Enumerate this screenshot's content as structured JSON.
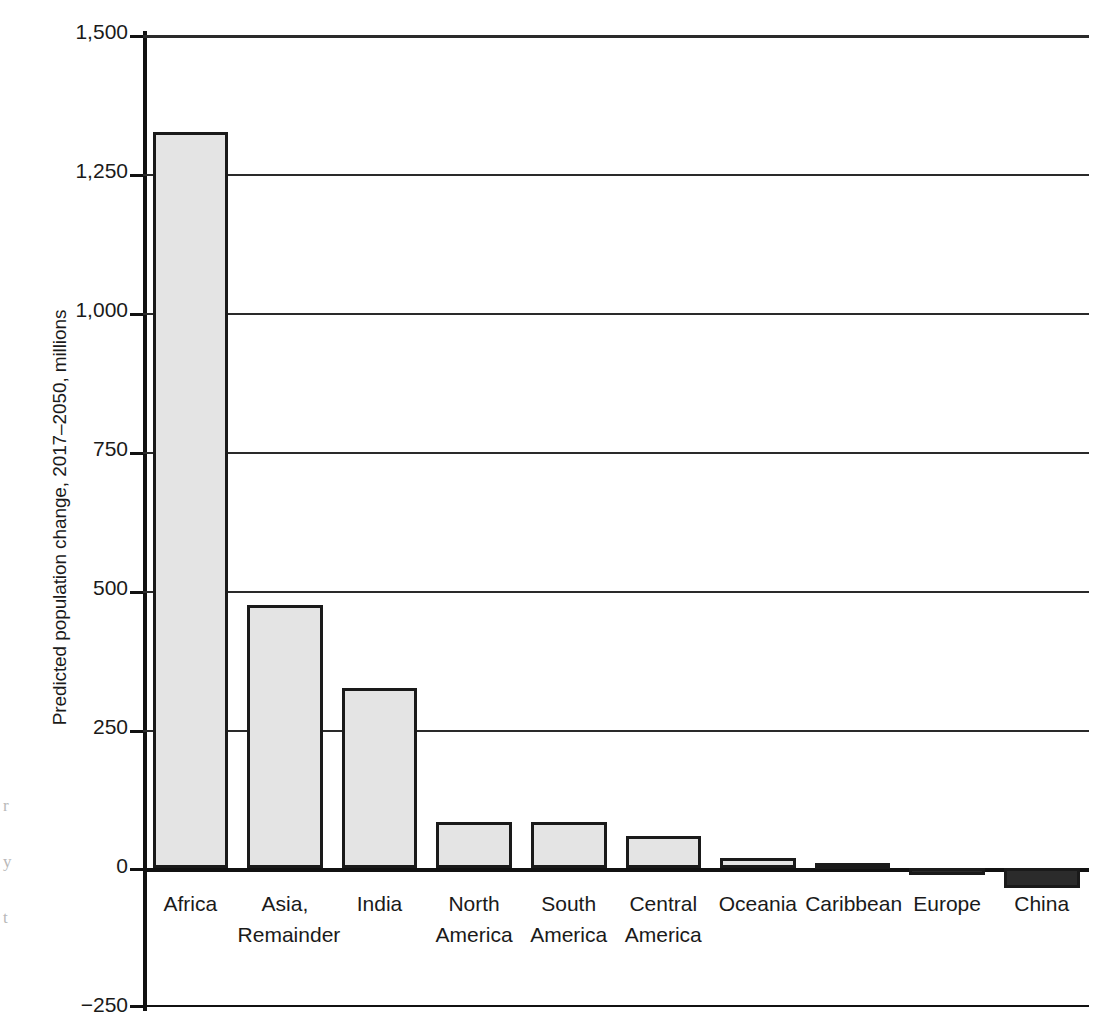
{
  "chart_data": {
    "type": "bar",
    "title": "",
    "xlabel": "",
    "ylabel": "Predicted population change, 2017–2050, millions",
    "categories": [
      "Africa",
      "Asia, Remainder",
      "India",
      "North America",
      "South America",
      "Central America",
      "Oceania",
      "Caribbean",
      "Europe",
      "China"
    ],
    "category_lines": [
      [
        "Africa"
      ],
      [
        "Asia,",
        "Remainder"
      ],
      [
        "India"
      ],
      [
        "North",
        "America"
      ],
      [
        "South",
        "America"
      ],
      [
        "Central",
        "America"
      ],
      [
        "Oceania"
      ],
      [
        "Caribbean"
      ],
      [
        "Europe"
      ],
      [
        "China"
      ]
    ],
    "values": [
      1323,
      473,
      324,
      83,
      83,
      57,
      18,
      2,
      -13,
      -36
    ],
    "ylim": [
      -250,
      1500
    ],
    "yticks": [
      1500,
      1250,
      1000,
      750,
      500,
      250,
      0,
      -250
    ],
    "ytick_labels": [
      "1,500",
      "1,250",
      "1,000",
      "750",
      "500",
      "250",
      "0",
      "−250"
    ],
    "grid": "horizontal",
    "legend": "none",
    "bar_colors": {
      "positive": "#e4e4e4",
      "negative": "#2b2b2b",
      "edge": "#1a1a1a"
    }
  },
  "edge_artifacts": [
    "r",
    "y",
    "t"
  ]
}
